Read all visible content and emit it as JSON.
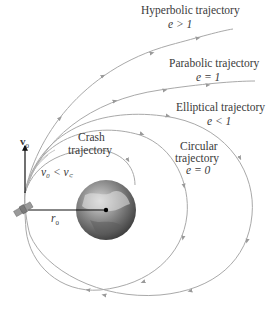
{
  "diagram": {
    "type": "orbital trajectories",
    "colors": {
      "trajectory": "#a9a9a9",
      "arrow": "#9a9a9a",
      "vector": "#111111",
      "text": "#3a3a3a",
      "earth_dark": "#3d3d3d",
      "earth_light": "#c8c8c8"
    },
    "labels": {
      "hyperbolic": {
        "name": "Hyperbolic trajectory",
        "condition": "e > 1"
      },
      "parabolic": {
        "name": "Parabolic trajectory",
        "condition": "e = 1"
      },
      "elliptical": {
        "name": "Elliptical trajectory",
        "condition": "e < 1"
      },
      "circular": {
        "name_line1": "Circular",
        "name_line2": "trajectory",
        "condition": "e = 0"
      },
      "crash": {
        "name_line1": "Crash",
        "name_line2": "trajectory"
      },
      "velocity": "v",
      "velocity_sub": "0",
      "velocity_condition": "v₀ < v꜀",
      "radius": "r",
      "radius_sub": "0"
    },
    "objects": [
      "satellite-icon",
      "earth-icon",
      "velocity-vector",
      "radius-line"
    ]
  }
}
